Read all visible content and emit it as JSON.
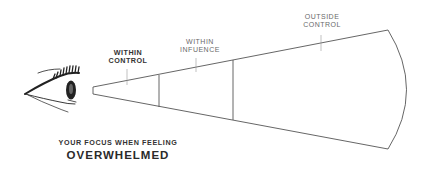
{
  "diagram": {
    "zones": [
      {
        "id": "within-control",
        "lines": [
          "WITHIN",
          "CONTROL"
        ],
        "emphasis": "bold"
      },
      {
        "id": "within-influence",
        "lines": [
          "WITHIN",
          "INFUENCE"
        ],
        "emphasis": "normal"
      },
      {
        "id": "outside-control",
        "lines": [
          "OUTSIDE",
          "CONTROL"
        ],
        "emphasis": "normal"
      }
    ],
    "caption": {
      "subtitle": "YOUR FOCUS WHEN FEELING",
      "title": "OVERWHELMED"
    },
    "icons": {
      "viewer": "eye-icon"
    },
    "colors": {
      "line": "#555555",
      "label_strong": "#333333",
      "label_light": "#6a6a6a",
      "eye": "#222222",
      "background": "#ffffff"
    }
  }
}
